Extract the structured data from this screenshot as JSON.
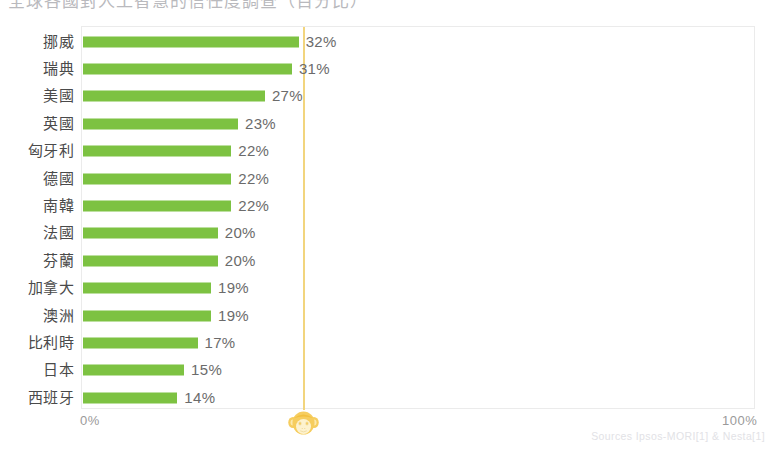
{
  "title": {
    "clipped_text": "全球各國對人工智慧的信任度調查（百分比）"
  },
  "axis": {
    "left_label": "0%",
    "right_label": "100%"
  },
  "marker": {
    "icon_name": "monkey-face-icon",
    "color": "#f5c84b"
  },
  "source": {
    "text": "Sources Ipsos-MORI[1] & Nesta[1]"
  },
  "colors": {
    "bar": "#7dc242",
    "reference_line": "#f2d57e",
    "plot_border": "#ebebeb",
    "label_text": "#4a4a4a",
    "value_text": "#6b6b6b"
  },
  "chart_data": {
    "type": "bar",
    "orientation": "horizontal",
    "title": "全球各國對人工智慧的信任度調查（百分比）",
    "xlabel": "",
    "ylabel": "",
    "xlim": [
      0,
      100
    ],
    "xticks": [
      "0%",
      "100%"
    ],
    "grid": false,
    "legend": null,
    "unit": "%",
    "annotations": [
      {
        "type": "vertical-reference-line",
        "value": 33,
        "color": "#f2d57e",
        "marker": "monkey-face-icon"
      }
    ],
    "categories": [
      "挪威",
      "瑞典",
      "美國",
      "英國",
      "匈牙利",
      "德國",
      "南韓",
      "法國",
      "芬蘭",
      "加拿大",
      "澳洲",
      "比利時",
      "日本",
      "西班牙"
    ],
    "values": [
      32,
      31,
      27,
      23,
      22,
      22,
      22,
      20,
      20,
      19,
      19,
      17,
      15,
      14
    ],
    "value_labels": [
      "32%",
      "31%",
      "27%",
      "23%",
      "22%",
      "22%",
      "22%",
      "20%",
      "20%",
      "19%",
      "19%",
      "17%",
      "15%",
      "14%"
    ]
  }
}
